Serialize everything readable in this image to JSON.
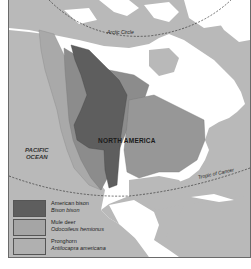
{
  "map": {
    "title_label": "NORTH AMERICA",
    "ocean_label_line1": "PACIFIC",
    "ocean_label_line2": "OCEAN",
    "arctic_circle_label": "Arctic Circle",
    "tropic_label": "Tropic of Cancer",
    "colors": {
      "ocean": "#b9b9b9",
      "land": "#ffffff",
      "bison": "#5e5e5e",
      "mule_deer": "#8c8c8c",
      "pronghorn": "#a9a9a9"
    }
  },
  "legend": {
    "items": [
      {
        "name": "American bison",
        "scientific": "Bison bison",
        "color": "#5e5e5e"
      },
      {
        "name": "Mule deer",
        "scientific": "Odocoileus hemionus",
        "color": "#8c8c8c"
      },
      {
        "name": "Pronghorn",
        "scientific": "Antilocapra americana",
        "color": "#a9a9a9"
      }
    ]
  }
}
